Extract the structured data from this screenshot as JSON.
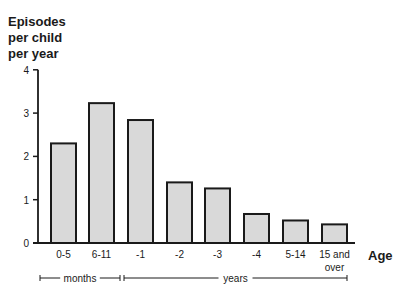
{
  "chart_data": {
    "type": "bar",
    "title": "",
    "ylabel": "Episodes per child per year",
    "ylabel_lines": [
      "Episodes",
      "per child",
      "per year"
    ],
    "xlabel": "Age",
    "categories": [
      "0-5",
      "6-11",
      "-1",
      "-2",
      "-3",
      "-4",
      "5-14",
      "15 and over"
    ],
    "category_lines": [
      [
        "0-5"
      ],
      [
        "6-11"
      ],
      [
        "-1"
      ],
      [
        "-2"
      ],
      [
        "-3"
      ],
      [
        "-4"
      ],
      [
        "5-14"
      ],
      [
        "15 and",
        "over"
      ]
    ],
    "values": [
      2.3,
      3.23,
      2.84,
      1.4,
      1.26,
      0.67,
      0.52,
      0.43
    ],
    "ylim": [
      0,
      4
    ],
    "yticks": [
      0,
      1,
      2,
      3,
      4
    ],
    "grid": false,
    "legend": null,
    "groups": [
      {
        "label": "months",
        "from": 0,
        "to": 1
      },
      {
        "label": "years",
        "from": 2,
        "to": 7
      }
    ],
    "bar_fill": "#d9d9d9",
    "bar_stroke": "#1a1a1a"
  }
}
